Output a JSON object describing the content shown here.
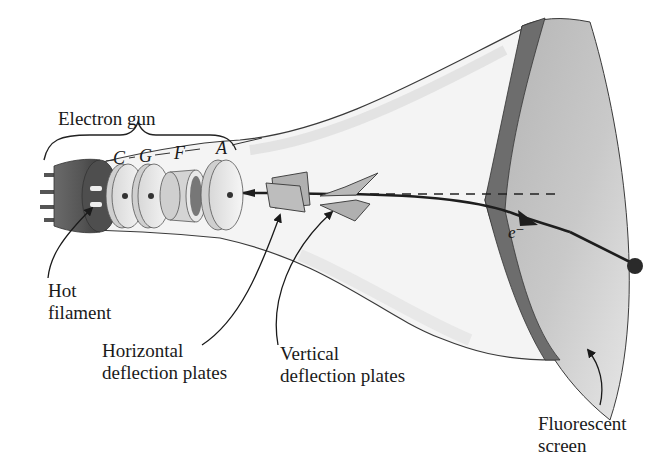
{
  "diagram": {
    "labels": {
      "electron_gun": "Electron gun",
      "gun_parts": {
        "c": "C",
        "g": "G",
        "f": "F",
        "a": "A"
      },
      "hot_filament": [
        "Hot",
        "filament"
      ],
      "horizontal_plates": [
        "Horizontal",
        "deflection plates"
      ],
      "vertical_plates": [
        "Vertical",
        "deflection plates"
      ],
      "fluorescent_screen": [
        "Fluorescent",
        "screen"
      ],
      "electron": "e⁻"
    },
    "colors": {
      "outline": "#3a3a3a",
      "glass": "#f2f2f2",
      "screen_face": "#c4c4c4",
      "screen_rim": "#6d6d6d",
      "plates": "#b5b5b5",
      "base": "#5f5f5f",
      "beam": "#1e1e1e"
    }
  }
}
